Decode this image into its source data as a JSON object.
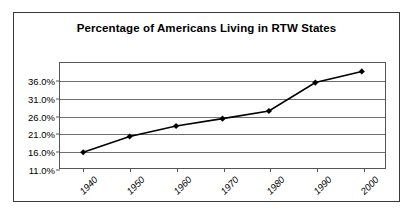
{
  "chart": {
    "title": "Percentage of Americans Living in RTW States",
    "line_color": "#000000",
    "marker_color": "#000000",
    "grid_color": "#6e6e6e",
    "border_color": "#3a3a3a",
    "background": "#ffffff"
  },
  "chart_data": {
    "type": "line",
    "title": "Percentage of Americans Living in RTW States",
    "xlabel": "",
    "ylabel": "",
    "x": [
      "1940",
      "1950",
      "1960",
      "1970",
      "1980",
      "1990",
      "2000"
    ],
    "categories": [
      "1940",
      "1950",
      "1960",
      "1970",
      "1980",
      "1990",
      "2000"
    ],
    "values": [
      15.5,
      20.0,
      23.0,
      25.1,
      27.3,
      35.4,
      38.6
    ],
    "series": [
      {
        "name": "Percentage of Americans Living in RTW States",
        "values": [
          15.5,
          20.0,
          23.0,
          25.1,
          27.3,
          35.4,
          38.6
        ]
      }
    ],
    "ylim": [
      11.0,
      41.0
    ],
    "ytick_values": [
      11.0,
      16.0,
      21.0,
      26.0,
      31.0,
      36.0,
      41.0
    ],
    "ytick_labels": [
      "11.0%",
      "16.0%",
      "21.0%",
      "26.0%",
      "31.0%",
      "36.0%",
      ""
    ],
    "xtick_labels": [
      "1940",
      "1950",
      "1960",
      "1970",
      "1980",
      "1990",
      "2000"
    ],
    "grid": true,
    "grid_axis": "y",
    "legend": false,
    "legend_position": "none",
    "marker": "diamond",
    "xtick_rotation": -45
  }
}
